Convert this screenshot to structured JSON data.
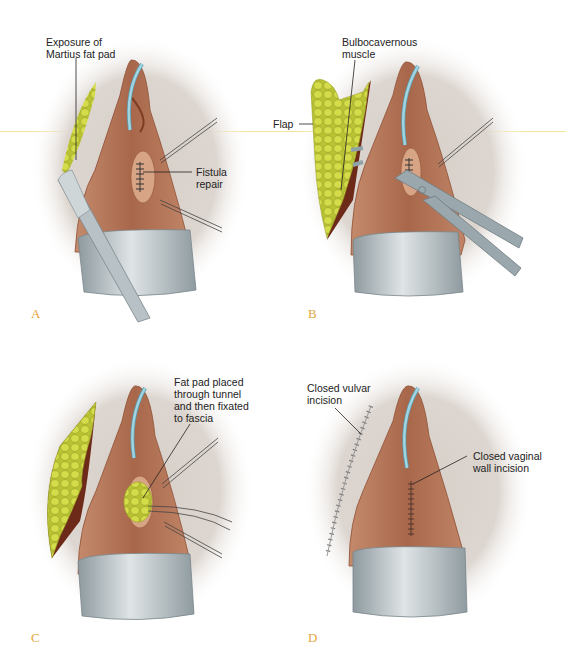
{
  "figure": {
    "colors": {
      "background": "#ffffff",
      "halo": "#d9d2cc",
      "tissue": "#b87a5c",
      "tissue_dark": "#8e4f33",
      "fat": "#c9d23c",
      "muscle": "#6e2a18",
      "catheter": "#8fc8d6",
      "retractor": "#a9b4b8",
      "panel_letter": "#e3a537"
    },
    "panels": [
      {
        "letter": "A",
        "labels": {
          "exposure": "Exposure of\nMartius fat pad",
          "fistula": "Fistula\nrepair"
        },
        "icons": [
          "scalpel-icon",
          "catheter-icon",
          "retractor-icon"
        ]
      },
      {
        "letter": "B",
        "labels": {
          "muscle": "Bulbocavernous\nmuscle",
          "flap": "Flap"
        },
        "icons": [
          "clamp-icon",
          "catheter-icon",
          "retractor-icon"
        ]
      },
      {
        "letter": "C",
        "labels": {
          "fatpad": "Fat pad placed\nthrough tunnel\nand then fixated\nto fascia"
        },
        "icons": [
          "catheter-icon",
          "retractor-icon"
        ]
      },
      {
        "letter": "D",
        "labels": {
          "vulvar": "Closed vulvar\nincision",
          "vaginal": "Closed vaginal\nwall incision"
        },
        "icons": [
          "catheter-icon",
          "retractor-icon"
        ]
      }
    ]
  }
}
